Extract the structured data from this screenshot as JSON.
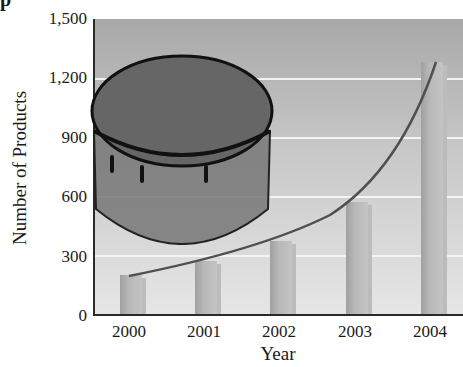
{
  "title_fragment": "p",
  "chart_data": {
    "type": "bar",
    "title": "",
    "xlabel": "Year",
    "ylabel": "Number of Products",
    "categories": [
      "2000",
      "2001",
      "2002",
      "2003",
      "2004"
    ],
    "values": [
      200,
      270,
      370,
      570,
      1280
    ],
    "ylim": [
      0,
      1500
    ],
    "yticks": [
      "0",
      "300",
      "600",
      "900",
      "1,200",
      "1,500"
    ],
    "grid": true,
    "trend_curve": "exponential curve through bar tops",
    "illustration": "cake (decorative image overlaid on plot)",
    "legend": null
  },
  "colors": {
    "background_top": "#a8a8a8",
    "background_bottom": "#e6e6e6",
    "bar": "#b4b4b4",
    "curve": "#505050",
    "gridline": "#f4f4f4"
  }
}
